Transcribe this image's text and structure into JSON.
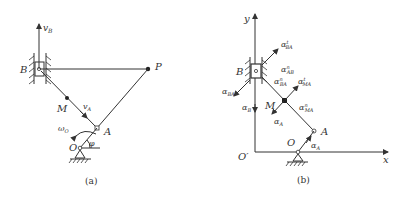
{
  "figure_a": {
    "caption": "(a)",
    "labels": {
      "B": "B",
      "P": "P",
      "M": "M",
      "A": "A",
      "O": "O",
      "vB": "v",
      "vB_sub": "B",
      "vA": "v",
      "vA_sub": "A",
      "omega": "ω",
      "omega_sub": "O",
      "phi": "φ"
    }
  },
  "figure_b": {
    "caption": "(b)",
    "labels": {
      "y": "y",
      "x": "x",
      "O_prime": "O′",
      "O": "O",
      "A": "A",
      "B": "B",
      "M": "M",
      "aB": "α",
      "aB_sub": "B",
      "aBA": "α",
      "aBA_sub": "BA",
      "aBA_t": "α",
      "aBA_t_sub": "BA",
      "aBA_t_sup": "t",
      "aAB_n": "α",
      "aAB_n_sub": "AB",
      "aAB_n_sup": "n",
      "aBA_n": "α",
      "aBA_n_sub": "BA",
      "aBA_n_sup": "n",
      "aMA_t": "α",
      "aMA_t_sub": "MA",
      "aMA_t_sup": "t",
      "aMA_n": "α",
      "aMA_n_sub": "MA",
      "aMA_n_sup": "n",
      "aA_M": "α",
      "aA_M_sub": "A",
      "aA": "α",
      "aA_sub": "A"
    }
  }
}
